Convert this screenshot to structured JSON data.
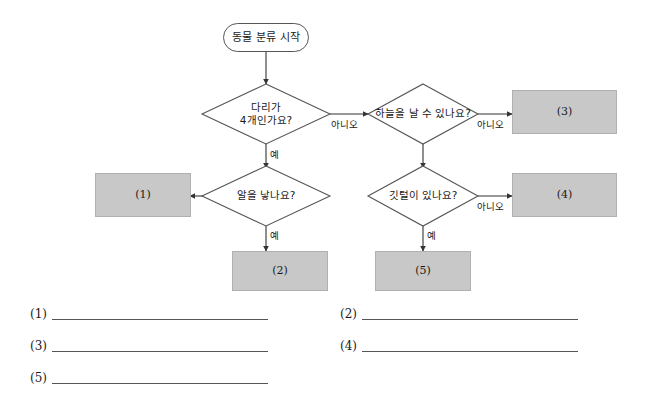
{
  "worksheet": {
    "title": "동물 분류 흐름도"
  },
  "flowchart": {
    "start": {
      "label": "동물 분류 시작"
    },
    "decisions": [
      {
        "id": "legs",
        "label": "다리가\n4개인가요?"
      },
      {
        "id": "fly",
        "label": "하늘을 날 수 있나요?"
      },
      {
        "id": "eggs",
        "label": "알을 낳나요?"
      },
      {
        "id": "feathers",
        "label": "깃털이 있나요?"
      }
    ],
    "outcomes": [
      {
        "id": "box1",
        "label": "(1)"
      },
      {
        "id": "box2",
        "label": "(2)"
      },
      {
        "id": "box3",
        "label": "(3)"
      },
      {
        "id": "box4",
        "label": "(4)"
      },
      {
        "id": "box5",
        "label": "(5)"
      }
    ],
    "edge_labels": {
      "legs_no": "아니오",
      "legs_yes": "예",
      "fly_no": "아니오",
      "eggs_yes": "예",
      "feathers_no": "아니오",
      "feathers_yes": "예"
    },
    "colors": {
      "box_fill": "#c8c8c8",
      "box_stroke": "#b0b0b0",
      "line": "#333333",
      "node_stroke": "#555555",
      "background": "#ffffff"
    }
  },
  "answers": {
    "blanks": [
      {
        "number": "(1)"
      },
      {
        "number": "(2)"
      },
      {
        "number": "(3)"
      },
      {
        "number": "(4)"
      },
      {
        "number": "(5)"
      }
    ]
  }
}
